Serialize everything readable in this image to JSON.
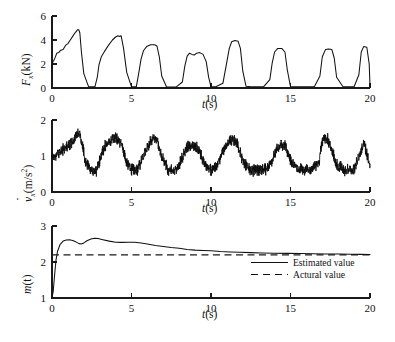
{
  "figure": {
    "background": "#ffffff",
    "line_color": "#111111",
    "panel_count": 3
  },
  "panels": [
    {
      "id": "force",
      "ylabel_parts": {
        "symbol": "F",
        "subscript": "x",
        "units": "(kN)"
      },
      "xlabel": "t(s)",
      "x_unit": "s",
      "y_unit": "kN"
    },
    {
      "id": "acceleration",
      "ylabel_parts": {
        "symbol": "v",
        "subscript": "x",
        "units": "(m/s",
        "units_exp": "2",
        "units_close": ")"
      },
      "xlabel": "t(s)",
      "x_unit": "s",
      "y_unit": "m/s^2"
    },
    {
      "id": "mass-estimate",
      "ylabel_parts": {
        "symbol": "m",
        "units": "(t)"
      },
      "xlabel": "t(s)",
      "x_unit": "s",
      "y_unit": "t"
    }
  ],
  "legend": {
    "position": "inside-right",
    "entries": [
      {
        "label": "Estimated value",
        "style": "solid"
      },
      {
        "label": "Actural value",
        "style": "dashed"
      }
    ]
  },
  "chart_data": [
    {
      "type": "line",
      "id": "force",
      "title": "",
      "xlabel": "t(s)",
      "ylabel": "F_x (kN)",
      "xlim": [
        0,
        20
      ],
      "ylim": [
        0,
        6
      ],
      "xticks": [
        0,
        5,
        10,
        15,
        20
      ],
      "yticks": [
        0,
        2,
        4,
        6
      ],
      "xtick_labels": [
        "0",
        "5",
        "10",
        "15",
        "20"
      ],
      "ytick_labels": [
        "0",
        "2",
        "4",
        "6"
      ],
      "grid": false,
      "series": [
        {
          "name": "F_x",
          "description": "Square-like traction force pulses, seven bursts of decreasing amplitude and width",
          "x": [
            0.0,
            0.05,
            0.12,
            0.2,
            0.3,
            0.42,
            0.55,
            0.7,
            0.85,
            1.0,
            1.15,
            1.3,
            1.45,
            1.6,
            1.68,
            1.75,
            1.85,
            2.0,
            2.3,
            2.7,
            2.85,
            2.95,
            3.1,
            3.3,
            3.55,
            3.8,
            4.0,
            4.15,
            4.25,
            4.35,
            4.5,
            4.7,
            5.0,
            5.3,
            5.45,
            5.6,
            5.75,
            5.95,
            6.2,
            6.45,
            6.6,
            6.75,
            6.9,
            7.2,
            7.8,
            8.2,
            8.35,
            8.5,
            8.65,
            8.8,
            8.95,
            9.1,
            9.3,
            9.5,
            9.7,
            9.85,
            10.0,
            10.3,
            10.75,
            11.0,
            11.15,
            11.3,
            11.5,
            11.7,
            11.85,
            12.0,
            12.2,
            12.5,
            13.3,
            13.7,
            13.85,
            14.0,
            14.2,
            14.45,
            14.65,
            14.8,
            15.0,
            15.4,
            16.5,
            16.85,
            17.0,
            17.2,
            17.4,
            17.6,
            17.75,
            17.9,
            18.3,
            19.0,
            19.3,
            19.45,
            19.6,
            19.8,
            19.95,
            20.0
          ],
          "y": [
            1.7,
            2.2,
            2.3,
            2.55,
            2.9,
            2.95,
            3.15,
            3.2,
            3.55,
            3.7,
            4.0,
            4.3,
            4.6,
            4.85,
            4.85,
            4.6,
            3.0,
            1.2,
            0.12,
            0.1,
            0.9,
            1.9,
            2.6,
            3.05,
            3.55,
            4.0,
            4.25,
            4.35,
            4.3,
            4.35,
            3.3,
            1.3,
            0.1,
            0.1,
            1.2,
            2.4,
            3.1,
            3.45,
            3.6,
            3.6,
            3.5,
            2.6,
            1.0,
            0.1,
            0.08,
            0.5,
            1.8,
            2.65,
            2.9,
            2.8,
            2.75,
            2.9,
            2.95,
            2.8,
            2.2,
            0.9,
            0.12,
            0.1,
            0.4,
            2.2,
            3.3,
            3.85,
            3.95,
            3.9,
            3.3,
            1.4,
            0.15,
            0.1,
            0.1,
            0.7,
            2.1,
            3.0,
            3.3,
            3.3,
            3.0,
            1.5,
            0.12,
            0.1,
            0.1,
            1.0,
            2.6,
            3.2,
            3.25,
            3.2,
            2.5,
            0.9,
            0.1,
            0.1,
            1.1,
            3.0,
            3.45,
            3.4,
            2.0,
            0.2
          ]
        }
      ]
    },
    {
      "type": "line",
      "id": "acceleration",
      "title": "",
      "xlabel": "t(s)",
      "ylabel": "v_dot_x (m/s^2)",
      "xlim": [
        0,
        20
      ],
      "ylim": [
        0,
        2
      ],
      "xticks": [
        0,
        5,
        10,
        15,
        20
      ],
      "yticks": [
        0,
        1,
        2
      ],
      "xtick_labels": [
        "0",
        "5",
        "10",
        "15",
        "20"
      ],
      "ytick_labels": [
        "0",
        "1",
        "2"
      ],
      "grid": false,
      "series": [
        {
          "name": "v_dot_x",
          "description": "Noisy acceleration signal oscillating between about 0.45 (low phase) and 1.6 (high phase), heavy high-frequency noise band of roughly +/-0.18",
          "envelope_x": [
            0.0,
            0.4,
            0.9,
            1.3,
            1.6,
            1.75,
            1.9,
            2.1,
            2.4,
            2.8,
            3.0,
            3.3,
            3.7,
            4.0,
            4.2,
            4.4,
            4.7,
            5.0,
            5.4,
            5.8,
            6.1,
            6.4,
            6.6,
            6.9,
            7.3,
            7.8,
            8.2,
            8.5,
            8.8,
            9.1,
            9.4,
            9.7,
            10.0,
            10.4,
            10.8,
            11.1,
            11.4,
            11.7,
            12.0,
            12.4,
            12.9,
            13.4,
            13.8,
            14.1,
            14.4,
            14.7,
            15.0,
            15.5,
            16.2,
            16.8,
            17.0,
            17.3,
            17.6,
            17.9,
            18.4,
            19.0,
            19.4,
            19.6,
            19.8,
            20.0
          ],
          "envelope_y": [
            0.95,
            1.1,
            1.25,
            1.4,
            1.6,
            1.65,
            1.3,
            0.85,
            0.62,
            0.6,
            0.85,
            1.25,
            1.45,
            1.5,
            1.45,
            1.3,
            0.8,
            0.62,
            0.62,
            1.05,
            1.35,
            1.5,
            1.45,
            1.0,
            0.6,
            0.58,
            0.95,
            1.25,
            1.3,
            1.25,
            1.0,
            0.7,
            0.62,
            0.75,
            1.2,
            1.4,
            1.45,
            1.3,
            0.85,
            0.62,
            0.6,
            0.62,
            0.85,
            1.15,
            1.35,
            1.25,
            0.9,
            0.62,
            0.6,
            0.85,
            1.45,
            1.5,
            1.2,
            0.75,
            0.6,
            0.62,
            1.1,
            1.35,
            1.1,
            0.7
          ],
          "noise_amplitude": 0.17
        }
      ]
    },
    {
      "type": "line",
      "id": "mass-estimate",
      "title": "",
      "xlabel": "t(s)",
      "ylabel": "m(t)",
      "xlim": [
        0,
        20
      ],
      "ylim": [
        1,
        3
      ],
      "xticks": [
        0,
        5,
        10,
        15,
        20
      ],
      "yticks": [
        1,
        2,
        3
      ],
      "xtick_labels": [
        "0",
        "5",
        "10",
        "15",
        "20"
      ],
      "ytick_labels": [
        "1",
        "2",
        "3"
      ],
      "grid": false,
      "series": [
        {
          "name": "Estimated value",
          "style": "solid",
          "description": "Rises steeply from 1 at t=0, overshoots to about 2.62, dips to 2.5, peaks near 2.66 around t=2.8, then slowly decays and converges to the actual value 2.2",
          "x": [
            0.0,
            0.08,
            0.16,
            0.25,
            0.35,
            0.5,
            0.7,
            0.9,
            1.1,
            1.3,
            1.5,
            1.7,
            1.85,
            2.0,
            2.2,
            2.45,
            2.7,
            2.9,
            3.2,
            3.6,
            4.0,
            4.4,
            4.8,
            5.2,
            5.6,
            6.0,
            6.5,
            7.0,
            7.5,
            8.0,
            8.5,
            9.0,
            9.5,
            10.0,
            10.6,
            11.2,
            11.8,
            12.5,
            13.2,
            14.0,
            14.8,
            15.6,
            16.4,
            17.2,
            18.0,
            18.8,
            19.4,
            20.0
          ],
          "y": [
            1.0,
            1.2,
            1.62,
            2.05,
            2.3,
            2.48,
            2.58,
            2.61,
            2.62,
            2.6,
            2.56,
            2.51,
            2.5,
            2.53,
            2.59,
            2.64,
            2.66,
            2.65,
            2.62,
            2.58,
            2.55,
            2.545,
            2.55,
            2.55,
            2.53,
            2.5,
            2.46,
            2.43,
            2.4,
            2.38,
            2.35,
            2.33,
            2.32,
            2.31,
            2.29,
            2.28,
            2.27,
            2.26,
            2.25,
            2.245,
            2.24,
            2.235,
            2.23,
            2.225,
            2.22,
            2.215,
            2.212,
            2.21
          ]
        },
        {
          "name": "Actural value",
          "style": "dashed",
          "description": "Constant reference line",
          "constant_y": 2.2,
          "x": [
            0,
            20
          ],
          "y": [
            2.2,
            2.2
          ]
        }
      ]
    }
  ]
}
